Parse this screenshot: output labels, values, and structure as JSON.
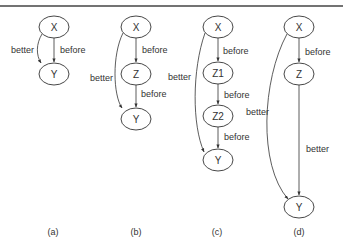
{
  "figure": {
    "panels": [
      {
        "id": "a",
        "caption": "(a)",
        "nodes": [
          {
            "id": "X",
            "label": "X"
          },
          {
            "id": "Y",
            "label": "Y"
          }
        ],
        "edges": [
          {
            "from": "X",
            "to": "Y",
            "label": "better",
            "style": "curved-left"
          },
          {
            "from": "X",
            "to": "Y",
            "label": "before",
            "style": "straight"
          }
        ]
      },
      {
        "id": "b",
        "caption": "(b)",
        "nodes": [
          {
            "id": "X",
            "label": "X"
          },
          {
            "id": "Z",
            "label": "Z"
          },
          {
            "id": "Y",
            "label": "Y"
          }
        ],
        "edges": [
          {
            "from": "X",
            "to": "Z",
            "label": "before"
          },
          {
            "from": "Z",
            "to": "Y",
            "label": "before"
          },
          {
            "from": "X",
            "to": "Y",
            "label": "better",
            "style": "curved-left"
          }
        ]
      },
      {
        "id": "c",
        "caption": "(c)",
        "nodes": [
          {
            "id": "X",
            "label": "X"
          },
          {
            "id": "Z1",
            "label": "Z1"
          },
          {
            "id": "Z2",
            "label": "Z2"
          },
          {
            "id": "Y",
            "label": "Y"
          }
        ],
        "edges": [
          {
            "from": "X",
            "to": "Z1",
            "label": "before"
          },
          {
            "from": "Z1",
            "to": "Z2",
            "label": "before"
          },
          {
            "from": "Z2",
            "to": "Y",
            "label": "before"
          },
          {
            "from": "X",
            "to": "Y",
            "label": "better",
            "style": "curved-left"
          }
        ]
      },
      {
        "id": "d",
        "caption": "(d)",
        "nodes": [
          {
            "id": "X",
            "label": "X"
          },
          {
            "id": "Z",
            "label": "Z"
          },
          {
            "id": "Y",
            "label": "Y"
          }
        ],
        "edges": [
          {
            "from": "X",
            "to": "Z",
            "label": "before"
          },
          {
            "from": "Z",
            "to": "Y",
            "label": "better"
          },
          {
            "from": "X",
            "to": "Y",
            "label": "better",
            "style": "curved-left"
          }
        ]
      }
    ]
  }
}
